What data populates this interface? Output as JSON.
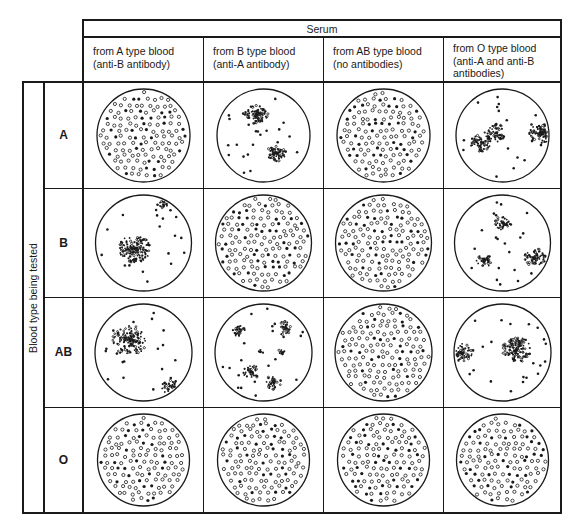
{
  "title": "Serum",
  "side_label": "Blood type being tested",
  "columns": [
    {
      "line1": "from A type blood",
      "line2": "(anti-B antibody)",
      "line3": ""
    },
    {
      "line1": "from B type blood",
      "line2": "(anti-A antibody)",
      "line3": ""
    },
    {
      "line1": "from AB type blood",
      "line2": "(no antibodies)",
      "line3": ""
    },
    {
      "line1": "from O type blood",
      "line2": "(anti-A and anti-B",
      "line3": "antibodies)"
    }
  ],
  "rows": [
    {
      "label": "A"
    },
    {
      "label": "B"
    },
    {
      "label": "AB"
    },
    {
      "label": "O"
    }
  ],
  "cells": [
    [
      {
        "result": "no agglutination",
        "clusters": []
      },
      {
        "result": "agglutination",
        "clusters": [
          [
            -0.15,
            -0.45,
            0.18,
            90
          ],
          [
            0.28,
            0.38,
            0.15,
            70
          ]
        ]
      },
      {
        "result": "no agglutination",
        "clusters": []
      },
      {
        "result": "agglutination",
        "clusters": [
          [
            -0.45,
            0.15,
            0.17,
            60
          ],
          [
            -0.15,
            -0.05,
            0.17,
            60
          ],
          [
            0.82,
            -0.05,
            0.18,
            100
          ]
        ]
      }
    ],
    [
      {
        "result": "agglutination",
        "clusters": [
          [
            -0.18,
            0.12,
            0.24,
            150
          ],
          [
            0.45,
            -0.82,
            0.1,
            25
          ]
        ]
      },
      {
        "result": "no agglutination",
        "clusters": []
      },
      {
        "result": "no agglutination",
        "clusters": []
      },
      {
        "result": "agglutination",
        "clusters": [
          [
            0.0,
            -0.42,
            0.12,
            40
          ],
          [
            -0.38,
            0.38,
            0.12,
            40
          ],
          [
            0.68,
            0.3,
            0.16,
            70
          ]
        ]
      }
    ],
    [
      {
        "result": "agglutination",
        "clusters": [
          [
            -0.28,
            -0.25,
            0.26,
            140
          ],
          [
            0.55,
            0.7,
            0.13,
            40
          ]
        ]
      },
      {
        "result": "agglutination",
        "clusters": [
          [
            -0.5,
            -0.45,
            0.1,
            30
          ],
          [
            0.42,
            -0.5,
            0.12,
            35
          ],
          [
            0.38,
            0.0,
            0.07,
            12
          ],
          [
            -0.25,
            0.4,
            0.12,
            40
          ],
          [
            0.2,
            0.62,
            0.12,
            35
          ],
          [
            -0.05,
            -0.02,
            0.04,
            6
          ]
        ]
      },
      {
        "result": "no agglutination",
        "clusters": []
      },
      {
        "result": "agglutination",
        "clusters": [
          [
            -0.85,
            0.0,
            0.16,
            70
          ],
          [
            0.3,
            -0.05,
            0.22,
            130
          ]
        ]
      }
    ],
    [
      {
        "result": "no agglutination",
        "clusters": []
      },
      {
        "result": "no agglutination",
        "clusters": []
      },
      {
        "result": "no agglutination",
        "clusters": []
      },
      {
        "result": "no agglutination",
        "clusters": []
      }
    ]
  ],
  "colors": {
    "ink": "#1a1a1a",
    "background": "#ffffff"
  }
}
